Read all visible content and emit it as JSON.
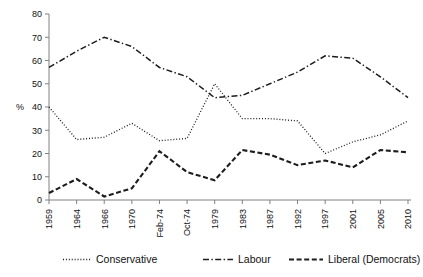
{
  "chart_data": {
    "type": "line",
    "title": "",
    "xlabel": "",
    "ylabel": "%",
    "ylim": [
      0,
      80
    ],
    "ytick_step": 10,
    "grid": false,
    "legend_position": "bottom",
    "categories": [
      "1959",
      "1964",
      "1966",
      "1970",
      "Feb-74",
      "Oct-74",
      "1979",
      "1983",
      "1987",
      "1992",
      "1997",
      "2001",
      "2005",
      "2010"
    ],
    "yticks": [
      "0",
      "10",
      "20",
      "30",
      "40",
      "50",
      "60",
      "70",
      "80"
    ],
    "series": [
      {
        "name": "Conservative",
        "style": "dotted",
        "values": [
          40,
          26,
          27,
          33,
          25.5,
          26.5,
          50,
          35,
          35,
          34,
          20,
          25,
          28,
          34
        ]
      },
      {
        "name": "Labour",
        "style": "dash-dot",
        "values": [
          57,
          64,
          70,
          66,
          57,
          53,
          44,
          45,
          50,
          55,
          62,
          61,
          53,
          44
        ]
      },
      {
        "name": "Liberal (Democrats)",
        "style": "dashed",
        "values": [
          3,
          9,
          1.5,
          5,
          21,
          12,
          8.5,
          21.5,
          19.5,
          15,
          17,
          14,
          21.5,
          20.5
        ]
      }
    ]
  },
  "legend": {
    "items": [
      {
        "label": "Conservative"
      },
      {
        "label": "Labour"
      },
      {
        "label": "Liberal (Democrats)"
      }
    ]
  }
}
